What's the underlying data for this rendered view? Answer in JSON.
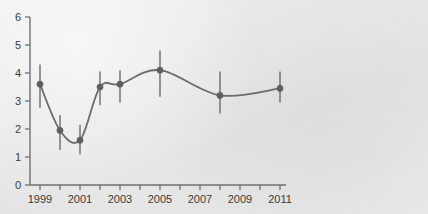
{
  "chart_data": {
    "type": "line",
    "title": "",
    "subtitle": "",
    "xlabel": "",
    "ylabel": "",
    "xlim": [
      1998.4,
      2011.6
    ],
    "ylim": [
      0,
      6
    ],
    "grid": false,
    "legend": false,
    "legend_position": "none",
    "series_name": "value",
    "line_color": "#6b6b6b",
    "marker_color": "#5f5f5f",
    "errorbar_color": "#6b6b6b",
    "axis_color": "#707070",
    "background_color": "#e8e8e8",
    "x": [
      1999,
      2000,
      2001,
      2002,
      2003,
      2005,
      2008,
      2011
    ],
    "values": [
      3.6,
      1.95,
      1.6,
      3.5,
      3.6,
      4.1,
      3.2,
      3.45
    ],
    "error_low": [
      2.75,
      1.25,
      1.1,
      2.85,
      2.95,
      3.15,
      2.55,
      2.95
    ],
    "error_high": [
      4.3,
      2.5,
      2.15,
      4.05,
      4.1,
      4.8,
      4.05,
      4.05
    ],
    "points": [
      {
        "x": 1999,
        "y": 3.6,
        "low": 2.75,
        "high": 4.3
      },
      {
        "x": 2000,
        "y": 1.95,
        "low": 1.25,
        "high": 2.5
      },
      {
        "x": 2001,
        "y": 1.6,
        "low": 1.1,
        "high": 2.15
      },
      {
        "x": 2002,
        "y": 3.5,
        "low": 2.85,
        "high": 4.05
      },
      {
        "x": 2003,
        "y": 3.6,
        "low": 2.95,
        "high": 4.1
      },
      {
        "x": 2005,
        "y": 4.1,
        "low": 3.15,
        "high": 4.8
      },
      {
        "x": 2008,
        "y": 3.2,
        "low": 2.55,
        "high": 4.05
      },
      {
        "x": 2011,
        "y": 3.45,
        "low": 2.95,
        "high": 4.05
      }
    ],
    "y_ticks": [
      0,
      1,
      2,
      3,
      4,
      5,
      6
    ],
    "y_tick_labels": [
      "0",
      "1",
      "2",
      "3",
      "4",
      "5",
      "6"
    ],
    "x_ticks": [
      1999,
      2000,
      2001,
      2002,
      2003,
      2004,
      2005,
      2006,
      2007,
      2008,
      2009,
      2010,
      2011
    ],
    "x_tick_labels": [
      "1999",
      "",
      "2001",
      "",
      "2003",
      "",
      "2005",
      "",
      "2007",
      "",
      "2009",
      "",
      "2011"
    ],
    "annotations": []
  }
}
